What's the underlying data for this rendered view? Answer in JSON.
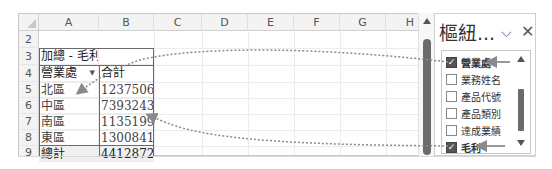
{
  "spreadsheet": {
    "columns": [
      "A",
      "B",
      "C",
      "D",
      "E",
      "F",
      "G",
      "H"
    ],
    "rows": [
      {
        "num": "2",
        "a": "",
        "b": ""
      },
      {
        "num": "3",
        "a": "加總 - 毛利",
        "b": ""
      },
      {
        "num": "4",
        "a": "營業處",
        "b": "合計",
        "a_has_filter": true
      },
      {
        "num": "5",
        "a": "北區",
        "b": "123750648"
      },
      {
        "num": "6",
        "a": "中區",
        "b": "73932430"
      },
      {
        "num": "7",
        "a": "南區",
        "b": "113519960"
      },
      {
        "num": "8",
        "a": "東區",
        "b": "130084170"
      },
      {
        "num": "9",
        "a": "總計",
        "b": "441287208"
      }
    ]
  },
  "pivot_panel": {
    "title": "樞紐...",
    "chevron_icon": "chevron-down-icon",
    "close_icon": "close-icon",
    "fields": [
      {
        "label": "營業處",
        "checked": true
      },
      {
        "label": "業務姓名",
        "checked": false
      },
      {
        "label": "產品代號",
        "checked": false
      },
      {
        "label": "產品類別",
        "checked": false
      },
      {
        "label": "達成業績",
        "checked": false
      },
      {
        "label": "毛利",
        "checked": true
      }
    ]
  },
  "colors": {
    "header_bg": "#f3f3f3",
    "grid_line": "#ececec",
    "pivot_border": "#6a6a6a",
    "scroll_thumb": "#6b6b6b",
    "annotation": "#8a8a8a"
  }
}
